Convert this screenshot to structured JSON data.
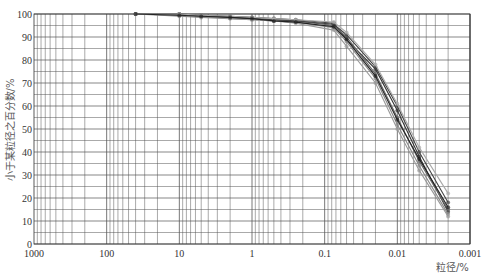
{
  "chart_data": {
    "type": "line",
    "title": "",
    "xlabel": "粒径/%",
    "ylabel": "小于某粒径之百分数/%",
    "x_scale": "log",
    "x_reversed": true,
    "xlim": [
      1000,
      0.001
    ],
    "ylim": [
      0,
      100
    ],
    "x_ticks": [
      "1000",
      "100",
      "10",
      "1",
      "0.1",
      "0.01",
      "0.001"
    ],
    "y_ticks": [
      "0",
      "10",
      "20",
      "30",
      "40",
      "50",
      "60",
      "70",
      "80",
      "90",
      "100"
    ],
    "grid": true,
    "legend": null,
    "series": [
      {
        "name": "sample-1",
        "x": [
          40,
          10,
          5,
          2,
          1,
          0.5,
          0.25,
          0.075,
          0.05,
          0.02,
          0.01,
          0.005,
          0.002
        ],
        "y": [
          100,
          100,
          99.5,
          99,
          98.5,
          98,
          97.5,
          96,
          89,
          76,
          58,
          38,
          14
        ]
      },
      {
        "name": "sample-2",
        "x": [
          40,
          10,
          5,
          2,
          1,
          0.5,
          0.25,
          0.075,
          0.05,
          0.02,
          0.01,
          0.005,
          0.002
        ],
        "y": [
          100,
          99.5,
          99,
          98.5,
          98,
          97.5,
          97,
          95,
          90,
          74,
          55,
          36,
          15
        ]
      },
      {
        "name": "sample-3",
        "x": [
          40,
          10,
          5,
          2,
          1,
          0.5,
          0.25,
          0.075,
          0.05,
          0.02,
          0.01,
          0.005,
          0.002
        ],
        "y": [
          100,
          99,
          98.5,
          98,
          97.5,
          97,
          96.5,
          94,
          88,
          72,
          52,
          34,
          13
        ]
      },
      {
        "name": "sample-4",
        "x": [
          40,
          10,
          5,
          2,
          1,
          0.5,
          0.25,
          0.075,
          0.05,
          0.02,
          0.01,
          0.005,
          0.002
        ],
        "y": [
          100,
          100,
          99,
          98.5,
          98,
          97.5,
          97,
          95.5,
          91,
          77,
          60,
          40,
          18
        ]
      },
      {
        "name": "sample-5",
        "x": [
          40,
          10,
          5,
          2,
          1,
          0.5,
          0.25,
          0.075,
          0.05,
          0.02,
          0.01,
          0.005,
          0.002
        ],
        "y": [
          100,
          99.5,
          99,
          98,
          97.5,
          97,
          96,
          93,
          86,
          70,
          50,
          32,
          12
        ]
      },
      {
        "name": "sample-6",
        "x": [
          40,
          10,
          5,
          2,
          1,
          0.5,
          0.25,
          0.075,
          0.05,
          0.02,
          0.01,
          0.005,
          0.002
        ],
        "y": [
          100,
          100,
          99.5,
          99,
          98.5,
          98,
          97.5,
          96.5,
          92,
          78,
          61,
          42,
          22
        ]
      },
      {
        "name": "sample-7",
        "x": [
          40,
          10,
          5,
          2,
          1,
          0.5,
          0.25,
          0.075,
          0.05,
          0.02,
          0.01,
          0.005,
          0.002
        ],
        "y": [
          100,
          99.5,
          99,
          98.5,
          98,
          97,
          96.5,
          94.5,
          89,
          73,
          54,
          37,
          16
        ]
      }
    ]
  },
  "colors": {
    "grid": "#555555",
    "axis": "#333333",
    "series": [
      "#333333",
      "#666666",
      "#888888",
      "#444444",
      "#999999",
      "#aaaaaa",
      "#222222"
    ]
  }
}
